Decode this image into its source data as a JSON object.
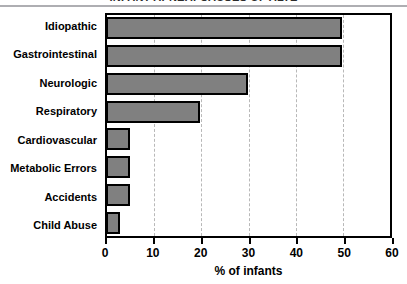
{
  "title_strip": {
    "text": "INFANT APNEA: CAUSES OF ALTE"
  },
  "chart_data": {
    "type": "bar",
    "orientation": "horizontal",
    "title": "",
    "xlabel": "% of infants",
    "ylabel": "",
    "categories": [
      "Idiopathic",
      "Gastrointestinal",
      "Neurologic",
      "Respiratory",
      "Cardiovascular",
      "Metabolic Errors",
      "Accidents",
      "Child Abuse"
    ],
    "values": [
      50,
      50,
      30,
      20,
      5,
      5,
      5,
      3
    ],
    "xlim": [
      0,
      60
    ],
    "xticks": [
      0,
      10,
      20,
      30,
      40,
      50,
      60
    ],
    "xticklabels": [
      "0",
      "10",
      "20",
      "30",
      "40",
      "50",
      "60"
    ],
    "gridlines": [
      10,
      20,
      30,
      40,
      50
    ],
    "grid": true,
    "legend": "none",
    "bar_color": "#808080",
    "bar_edge_color": "#000000",
    "background_color": "#ffffff"
  }
}
